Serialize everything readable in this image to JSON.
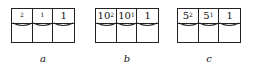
{
  "figure": {
    "groups": [
      {
        "id": "a",
        "caption": "a",
        "cells": [
          {
            "base": "",
            "exp": "2"
          },
          {
            "base": "",
            "exp": "1"
          },
          {
            "base": "1",
            "exp": ""
          }
        ]
      },
      {
        "id": "b",
        "caption": "b",
        "cells": [
          {
            "base": "10",
            "exp": "2"
          },
          {
            "base": "10",
            "exp": "1"
          },
          {
            "base": "1",
            "exp": ""
          }
        ]
      },
      {
        "id": "c",
        "caption": "c",
        "cells": [
          {
            "base": "5",
            "exp": "2"
          },
          {
            "base": "5",
            "exp": "1"
          },
          {
            "base": "1",
            "exp": ""
          }
        ]
      }
    ]
  }
}
